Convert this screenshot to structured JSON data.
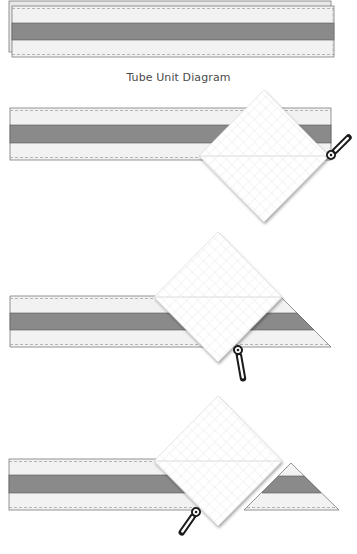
{
  "caption": "Tube Unit Diagram",
  "colors": {
    "strip_light": "#f2f2f2",
    "strip_dark": "#8a8a8a",
    "strip_outline": "#7a7a7a",
    "seam_dash": "#9a9a9a",
    "ruler_fill": "#ffffff",
    "ruler_grid": "#dcdcdc",
    "ruler_diag": "#cfcfcf",
    "cutter": "#1a1a1a"
  },
  "steps": [
    {
      "id": "tube-unit",
      "description": "Two strips sewn into a tube"
    },
    {
      "id": "step-1",
      "description": "Square ruler placed on tube, cutter at right edge"
    },
    {
      "id": "step-2",
      "description": "Ruler repositioned, triangle cut on right"
    },
    {
      "id": "step-3",
      "description": "Ruler repositioned, triangle unit separated"
    }
  ]
}
